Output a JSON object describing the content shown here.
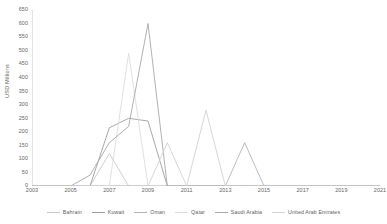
{
  "chart_data": {
    "type": "line",
    "title": "",
    "subtitle": "",
    "xlabel": "",
    "ylabel": "USD Millions",
    "xlim": [
      2003,
      2021
    ],
    "ylim": [
      0,
      650
    ],
    "y_ticks": [
      0,
      50,
      100,
      150,
      200,
      250,
      300,
      350,
      400,
      450,
      500,
      550,
      600,
      650
    ],
    "x_ticks": [
      2003,
      2005,
      2007,
      2009,
      2011,
      2013,
      2015,
      2017,
      2019,
      2021
    ],
    "x": [
      2003,
      2004,
      2005,
      2006,
      2007,
      2008,
      2009,
      2010,
      2011,
      2012,
      2013,
      2014,
      2015,
      2016,
      2017,
      2018,
      2019,
      2020,
      2021
    ],
    "grid": false,
    "legend_position": "bottom",
    "series": [
      {
        "name": "Bahrain",
        "color": "#c8c8c8",
        "values": [
          0,
          0,
          0,
          0,
          120,
          0,
          0,
          0,
          0,
          0,
          0,
          0,
          0,
          0,
          0,
          0,
          0,
          0,
          0
        ]
      },
      {
        "name": "Kuwait",
        "color": "#9e9e9e",
        "values": [
          0,
          0,
          0,
          0,
          215,
          250,
          240,
          0,
          0,
          0,
          0,
          0,
          0,
          0,
          0,
          0,
          0,
          0,
          0
        ]
      },
      {
        "name": "Oman",
        "color": "#b5b5b5",
        "values": [
          0,
          0,
          0,
          0,
          0,
          0,
          0,
          0,
          0,
          0,
          0,
          160,
          0,
          0,
          0,
          0,
          0,
          0,
          0
        ]
      },
      {
        "name": "Qatar",
        "color": "#dcdcdc",
        "values": [
          0,
          0,
          0,
          0,
          0,
          490,
          0,
          0,
          0,
          0,
          0,
          0,
          0,
          0,
          0,
          0,
          0,
          0,
          0
        ]
      },
      {
        "name": "Saudi Arabia",
        "color": "#a8a8a8",
        "values": [
          0,
          0,
          0,
          40,
          160,
          220,
          600,
          0,
          0,
          0,
          0,
          0,
          0,
          0,
          0,
          0,
          0,
          0,
          0
        ]
      },
      {
        "name": "United Arab Emirates",
        "color": "#d2d2d2",
        "values": [
          0,
          0,
          0,
          0,
          0,
          0,
          0,
          160,
          0,
          280,
          0,
          0,
          0,
          0,
          0,
          0,
          0,
          0,
          0
        ]
      }
    ]
  }
}
